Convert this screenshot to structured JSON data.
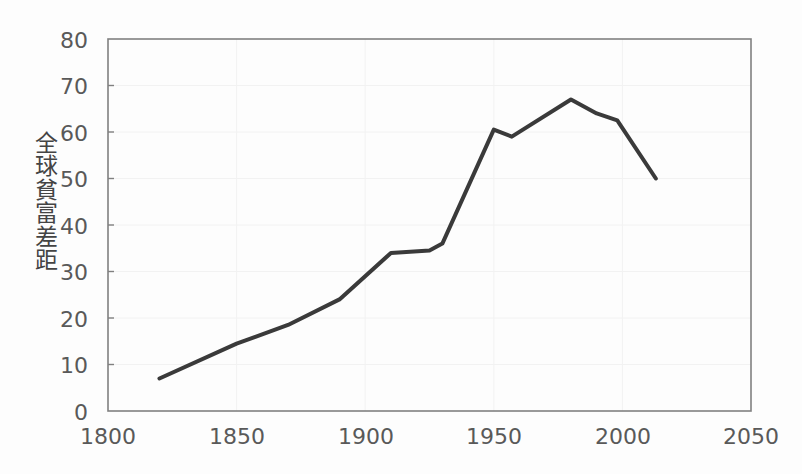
{
  "chart_data": {
    "type": "line",
    "title": "",
    "subtitle": "",
    "xlabel": "",
    "ylabel": "全球貧富差距",
    "ylabel_chars": [
      "全",
      "球",
      "貧",
      "富",
      "差",
      "距"
    ],
    "xlim": [
      1800,
      2050
    ],
    "ylim": [
      0,
      80
    ],
    "xticks": [
      1800,
      1850,
      1900,
      1950,
      2000,
      2050
    ],
    "yticks": [
      0,
      10,
      20,
      30,
      40,
      50,
      60,
      70,
      80
    ],
    "xtick_labels": [
      "1800",
      "1850",
      "1900",
      "1950",
      "2000",
      "2050"
    ],
    "ytick_labels": [
      "0",
      "10",
      "20",
      "30",
      "40",
      "50",
      "60",
      "70",
      "80"
    ],
    "grid": true,
    "grid_color": "#f2f2f2",
    "legend": null,
    "legend_position": "none",
    "series": [
      {
        "name": "全球貧富差距",
        "color": "#3a3a3a",
        "line_width": 4,
        "markers": false,
        "x": [
          1820,
          1850,
          1870,
          1890,
          1910,
          1925,
          1930,
          1950,
          1957,
          1980,
          1990,
          1998,
          2013
        ],
        "values": [
          7,
          14.5,
          18.5,
          24,
          34,
          34.5,
          36,
          60.5,
          59,
          67,
          64,
          62.5,
          50
        ]
      }
    ],
    "annotations": []
  },
  "axes": {
    "frame_color": "#808080",
    "tick_label_color": "#595959",
    "background": "#fdfdfd"
  }
}
